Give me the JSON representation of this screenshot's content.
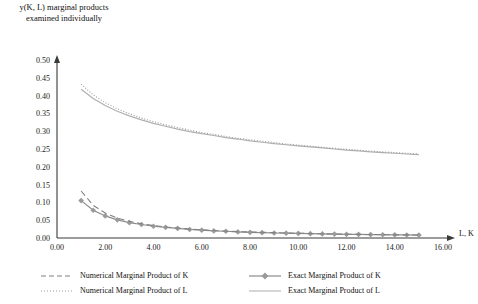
{
  "chart_data": {
    "type": "line",
    "title": "y(K, L) marginal products examined individually",
    "xlabel": "L, K",
    "ylabel": "",
    "xlim": [
      0,
      16
    ],
    "ylim": [
      0,
      0.5
    ],
    "xticks": [
      "0.00",
      "2.00",
      "4.00",
      "6.00",
      "8.00",
      "10.00",
      "12.00",
      "14.00",
      "16.00"
    ],
    "xtick_values": [
      0,
      2,
      4,
      6,
      8,
      10,
      12,
      14,
      16
    ],
    "yticks": [
      "0.00",
      "0.05",
      "0.10",
      "0.15",
      "0.20",
      "0.25",
      "0.30",
      "0.35",
      "0.40",
      "0.45",
      "0.50"
    ],
    "ytick_values": [
      0,
      0.05,
      0.1,
      0.15,
      0.2,
      0.25,
      0.3,
      0.35,
      0.4,
      0.45,
      0.5
    ],
    "grid": false,
    "legend_position": "bottom",
    "x": [
      1.0,
      1.5,
      2.0,
      2.5,
      3.0,
      3.5,
      4.0,
      4.5,
      5.0,
      5.5,
      6.0,
      6.5,
      7.0,
      7.5,
      8.0,
      8.5,
      9.0,
      9.5,
      10.0,
      10.5,
      11.0,
      11.5,
      12.0,
      12.5,
      13.0,
      13.5,
      14.0,
      14.5,
      15.0
    ],
    "series": [
      {
        "name": "Numerical Marginal Product of K",
        "style": "dashed",
        "color": "#808080",
        "marker": "none",
        "values": [
          0.132,
          0.092,
          0.07,
          0.056,
          0.047,
          0.04,
          0.035,
          0.031,
          0.028,
          0.025,
          0.023,
          0.021,
          0.019,
          0.018,
          0.017,
          0.016,
          0.015,
          0.014,
          0.0132,
          0.0125,
          0.0118,
          0.0112,
          0.0107,
          0.0102,
          0.0098,
          0.0094,
          0.009,
          0.0087,
          0.0084
        ]
      },
      {
        "name": "Exact Marginal Product of K",
        "style": "solid",
        "color": "#8c8c8c",
        "marker": "diamond",
        "values": [
          0.105,
          0.078,
          0.062,
          0.051,
          0.043,
          0.038,
          0.033,
          0.03,
          0.027,
          0.024,
          0.022,
          0.02,
          0.019,
          0.017,
          0.016,
          0.015,
          0.014,
          0.0136,
          0.0128,
          0.0121,
          0.0115,
          0.0109,
          0.0104,
          0.01,
          0.0096,
          0.0092,
          0.0088,
          0.0085,
          0.0082
        ]
      },
      {
        "name": "Numerical Marginal Product of L",
        "style": "dotted",
        "color": "#9a9a9a",
        "marker": "none",
        "values": [
          0.432,
          0.402,
          0.38,
          0.363,
          0.349,
          0.337,
          0.327,
          0.318,
          0.31,
          0.303,
          0.296,
          0.291,
          0.285,
          0.28,
          0.276,
          0.272,
          0.268,
          0.264,
          0.261,
          0.258,
          0.255,
          0.252,
          0.249,
          0.247,
          0.244,
          0.242,
          0.24,
          0.238,
          0.236
        ]
      },
      {
        "name": "Exact Marginal Product of L",
        "style": "solid",
        "color": "#b0b0b0",
        "marker": "none",
        "values": [
          0.418,
          0.392,
          0.372,
          0.356,
          0.343,
          0.332,
          0.322,
          0.314,
          0.306,
          0.299,
          0.293,
          0.288,
          0.282,
          0.278,
          0.273,
          0.269,
          0.265,
          0.262,
          0.259,
          0.256,
          0.253,
          0.25,
          0.247,
          0.245,
          0.242,
          0.24,
          0.238,
          0.236,
          0.234
        ]
      }
    ]
  },
  "legend": {
    "items": [
      {
        "label": "Numerical Marginal Product of K"
      },
      {
        "label": "Exact Marginal Product of K"
      },
      {
        "label": "Numerical Marginal Product of L"
      },
      {
        "label": "Exact Marginal Product of L"
      }
    ]
  }
}
